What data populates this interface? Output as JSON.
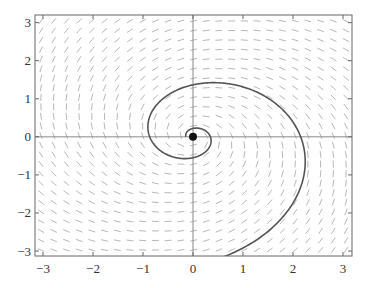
{
  "chart_data": {
    "type": "line",
    "title": "",
    "subtitle": "Phase portrait: spiral trajectory with direction field",
    "xlabel": "",
    "ylabel": "",
    "xlim": [
      -3.16,
      3.18
    ],
    "ylim": [
      -3.13,
      3.2
    ],
    "x_ticks": [
      -3,
      -2,
      -1,
      0,
      1,
      2,
      3
    ],
    "y_ticks": [
      -3,
      -2,
      -1,
      0,
      1,
      2,
      3
    ],
    "x_tick_labels": [
      "−3",
      "−2",
      "−1",
      "0",
      "1",
      "2",
      "3"
    ],
    "y_tick_labels": [
      "−3",
      "−2",
      "−1",
      "0",
      "1",
      "2",
      "3"
    ],
    "grid": false,
    "axes_lines_through_origin": true,
    "legend": null,
    "equilibrium": {
      "x": 0,
      "y": 0,
      "type": "spiral"
    },
    "trajectory": {
      "form": "logarithmic spiral r = a*exp(b*theta), clockwise outward",
      "a": 0.14,
      "b": 0.29,
      "theta_start": 0,
      "theta_end": 11.6,
      "approx_axis_crossings": {
        "positive_x": [
          0.06,
          0.35,
          1.4
        ],
        "negative_x": [
          -0.16,
          -0.42,
          -1.05,
          -2.55
        ]
      }
    },
    "direction_field": {
      "equations": "dx/dt = 0.29*x + y, dy/dt = -x + 0.29*y",
      "grid_nx": 25,
      "grid_ny": 25,
      "segment_length_px": 7
    },
    "colors": {
      "trajectory": "#555555",
      "field": "#b8b8b8",
      "axes": "#888888",
      "frame": "#666666",
      "equilibrium": "#111111"
    }
  }
}
